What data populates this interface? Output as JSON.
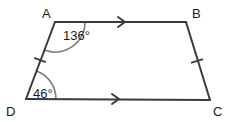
{
  "figure": {
    "type": "geometry-diagram",
    "shape_name": "trapezoid",
    "stroke_color": "#3a3a3a",
    "arc_color": "#7c7c7c",
    "text_color": "#1a1a1a",
    "background_color": "#ffffff",
    "stroke_width": 2,
    "vertices": [
      {
        "name": "A",
        "label": "A",
        "x": 55,
        "y": 22,
        "label_x": 42,
        "label_y": 18
      },
      {
        "name": "B",
        "label": "B",
        "x": 186,
        "y": 22,
        "label_x": 192,
        "label_y": 18
      },
      {
        "name": "C",
        "label": "C",
        "x": 210,
        "y": 100,
        "label_x": 213,
        "label_y": 116
      },
      {
        "name": "D",
        "label": "D",
        "x": 26,
        "y": 99,
        "label_x": 6,
        "label_y": 116
      }
    ],
    "edges": [
      {
        "name": "edge-AB",
        "from": "A",
        "to": "B",
        "marks": "single-arrow",
        "parallel_group": 1
      },
      {
        "name": "edge-BC",
        "from": "B",
        "to": "C",
        "marks": "single-tick",
        "congruence_group": 1
      },
      {
        "name": "edge-DC",
        "from": "D",
        "to": "C",
        "marks": "single-arrow",
        "parallel_group": 1
      },
      {
        "name": "edge-AD",
        "from": "A",
        "to": "D",
        "marks": "single-tick",
        "congruence_group": 1
      }
    ],
    "angles": [
      {
        "name": "angle-A",
        "vertex": "A",
        "value": 136,
        "label": "136°",
        "label_x": 63,
        "label_y": 40,
        "radius": 30
      },
      {
        "name": "angle-D",
        "vertex": "D",
        "value": 46,
        "label": "46°",
        "label_x": 33,
        "label_y": 98,
        "radius": 30
      }
    ],
    "arrow_markers": [
      {
        "name": "arrow-marker-AB",
        "x": 124,
        "y": 22
      },
      {
        "name": "arrow-marker-DC",
        "x": 118,
        "y": 99
      }
    ],
    "tick_markers": [
      {
        "name": "tick-marker-AD",
        "x": 40,
        "y": 60
      },
      {
        "name": "tick-marker-BC",
        "x": 197,
        "y": 61
      }
    ]
  }
}
